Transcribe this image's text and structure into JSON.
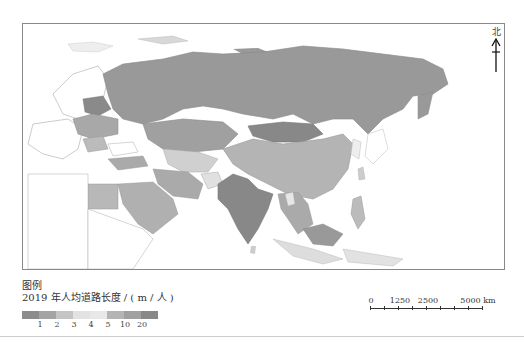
{
  "map": {
    "north_label": "北",
    "colors": {
      "no_data": "#ffffff",
      "c1": "#8a8a8a",
      "c2": "#a2a2a2",
      "c3": "#bdbdbd",
      "c4": "#dcdcdc",
      "c5": "#e6e6e6",
      "c10": "#b0b0b0",
      "c20": "#999999",
      "c_max": "#7d7d7d",
      "border": "#9a9a9a",
      "frame": "#888888"
    }
  },
  "legend": {
    "title": "图例",
    "subtitle": "2019 年人均道路长度 / ( m / 人 )",
    "swatches": [
      "#8c8c8c",
      "#a4a4a4",
      "#c4c4c4",
      "#e2e2e2",
      "#e8e8e8",
      "#b4b4b4",
      "#a0a0a0",
      "#888888"
    ],
    "ticks": [
      "1",
      "2",
      "3",
      "4",
      "5",
      "10",
      "20"
    ]
  },
  "scale_bar": {
    "labels": [
      "0",
      "1250",
      "2500",
      "5000 km"
    ],
    "unit": "km"
  }
}
